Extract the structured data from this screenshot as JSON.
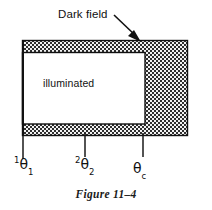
{
  "figure": {
    "caption": "Figure 11–4",
    "annotations": {
      "dark_field_label": "Dark field",
      "illuminated_label": "illuminated"
    },
    "axis_labels": [
      {
        "name": "theta-1",
        "superscript": "1",
        "symbol": "θ",
        "subscript": "1",
        "tick_x": 22
      },
      {
        "name": "theta-2",
        "superscript": "2",
        "symbol": "θ",
        "subscript": "2",
        "tick_x": 85
      },
      {
        "name": "theta-c",
        "superscript": "",
        "symbol": "θ",
        "subscript": "c",
        "tick_x": 143
      }
    ],
    "regions": {
      "outer_rect": {
        "x": 22,
        "y": 40,
        "width": 166,
        "height": 96,
        "fill": "dark-hatch"
      },
      "illuminated_rect": {
        "x": 23,
        "y": 52,
        "width": 122,
        "height": 72,
        "fill": "#ffffff"
      }
    },
    "colors": {
      "hatch_dark": "#3a3a3a",
      "hatch_light": "#e8e8e8",
      "stroke": "#111111",
      "background": "#ffffff"
    },
    "arrow": {
      "name": "dark-field-pointer",
      "from_x": 116,
      "from_y": 16,
      "to_x": 140,
      "to_y": 41
    }
  }
}
